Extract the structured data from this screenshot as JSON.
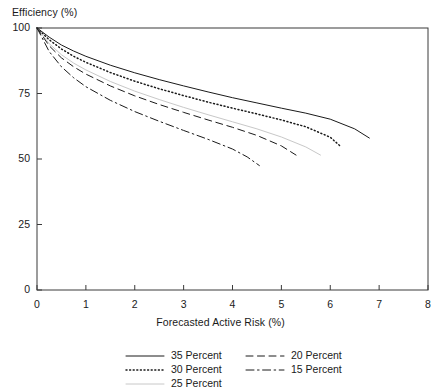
{
  "chart_data": {
    "type": "line",
    "title": "",
    "xlabel": "Forecasted Active Risk (%)",
    "ylabel": "Efficiency (%)",
    "xlim": [
      0,
      8
    ],
    "ylim": [
      0,
      100
    ],
    "xticks": [
      "0",
      "1",
      "2",
      "3",
      "4",
      "5",
      "6",
      "7",
      "8"
    ],
    "yticks": [
      "0",
      "25",
      "50",
      "75",
      "100"
    ],
    "grid": false,
    "legend_position": "below-axes",
    "series": [
      {
        "name": "35 Percent",
        "style": "solid",
        "color": "#1a1a1a",
        "x": [
          0,
          0.25,
          0.5,
          0.75,
          1,
          1.5,
          2,
          2.5,
          3,
          3.5,
          4,
          4.5,
          5,
          5.5,
          6,
          6.5,
          6.8
        ],
        "y": [
          100,
          96.5,
          93.5,
          91.2,
          89.2,
          85.8,
          82.9,
          80.3,
          77.9,
          75.6,
          73.4,
          71.4,
          69.4,
          67.5,
          65.2,
          61.5,
          58.0
        ]
      },
      {
        "name": "30 Percent",
        "style": "dotted",
        "color": "#1a1a1a",
        "x": [
          0,
          0.25,
          0.5,
          0.75,
          1,
          1.5,
          2,
          2.5,
          3,
          3.5,
          4,
          4.5,
          5,
          5.5,
          6,
          6.2
        ],
        "y": [
          100,
          95.5,
          92.0,
          89.2,
          86.9,
          83.0,
          79.7,
          76.8,
          74.2,
          71.7,
          69.4,
          67.2,
          64.9,
          62.3,
          58.3,
          55.0
        ]
      },
      {
        "name": "25 Percent",
        "style": "solid-light",
        "color": "#c8c8c8",
        "x": [
          0,
          0.25,
          0.5,
          0.75,
          1,
          1.5,
          2,
          2.5,
          3,
          3.5,
          4,
          4.5,
          5,
          5.5,
          5.8
        ],
        "y": [
          100,
          94.0,
          89.8,
          86.6,
          84.0,
          79.6,
          75.9,
          72.7,
          69.7,
          66.9,
          64.2,
          61.5,
          58.4,
          54.6,
          51.5
        ]
      },
      {
        "name": "20 Percent",
        "style": "dashed",
        "color": "#1a1a1a",
        "x": [
          0,
          0.25,
          0.5,
          0.75,
          1,
          1.5,
          2,
          2.5,
          3,
          3.5,
          4,
          4.5,
          5,
          5.3
        ],
        "y": [
          100,
          93.2,
          88.6,
          85.2,
          82.4,
          77.9,
          74.1,
          70.8,
          67.8,
          64.9,
          62.1,
          59.0,
          55.0,
          51.5
        ]
      },
      {
        "name": "15 Percent",
        "style": "dashdot",
        "color": "#1a1a1a",
        "x": [
          0,
          0.25,
          0.5,
          0.75,
          1,
          1.5,
          2,
          2.5,
          3,
          3.5,
          4,
          4.3,
          4.55
        ],
        "y": [
          100,
          91.0,
          85.2,
          81.0,
          77.6,
          72.4,
          68.1,
          64.4,
          60.9,
          57.5,
          53.8,
          50.8,
          47.5
        ]
      }
    ]
  },
  "legend": {
    "column1": [
      {
        "label": "35 Percent",
        "style": "solid"
      },
      {
        "label": "30 Percent",
        "style": "dotted"
      },
      {
        "label": "25 Percent",
        "style": "solid-light"
      }
    ],
    "column2": [
      {
        "label": "20 Percent",
        "style": "dashed"
      },
      {
        "label": "15 Percent",
        "style": "dashdot"
      }
    ]
  }
}
